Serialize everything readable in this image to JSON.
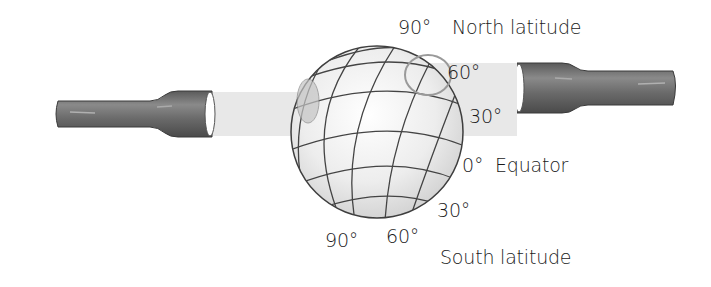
{
  "diagram": {
    "labels": {
      "north_90": "90°",
      "north_latitude": "North latitude",
      "north_60": "60°",
      "north_30": "30°",
      "equator_0": "0°",
      "equator": "Equator",
      "south_30": "30°",
      "south_60": "60°",
      "south_90": "90°",
      "south_latitude": "South latitude"
    },
    "colors": {
      "tube": "#6f6f6f",
      "tube_dark": "#4a4a4a",
      "beam": "#e6e6e6",
      "globe_fill": "#ececec",
      "grid_line": "#444444",
      "spot": "#b8b8b8"
    }
  }
}
